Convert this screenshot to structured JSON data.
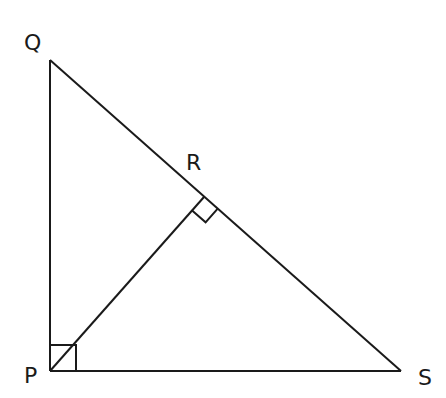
{
  "diagram": {
    "type": "right-triangle-with-altitude",
    "points": {
      "Q": {
        "label": "Q",
        "x": 50,
        "y": 60
      },
      "P": {
        "label": "P",
        "x": 50,
        "y": 371
      },
      "S": {
        "label": "S",
        "x": 401,
        "y": 371
      },
      "R": {
        "label": "R",
        "x": 204,
        "y": 197
      }
    },
    "segments": [
      "QP",
      "PS",
      "QS",
      "PR"
    ],
    "right_angles": [
      "QPS",
      "PRS"
    ],
    "stroke_color": "#1a1a1a"
  }
}
